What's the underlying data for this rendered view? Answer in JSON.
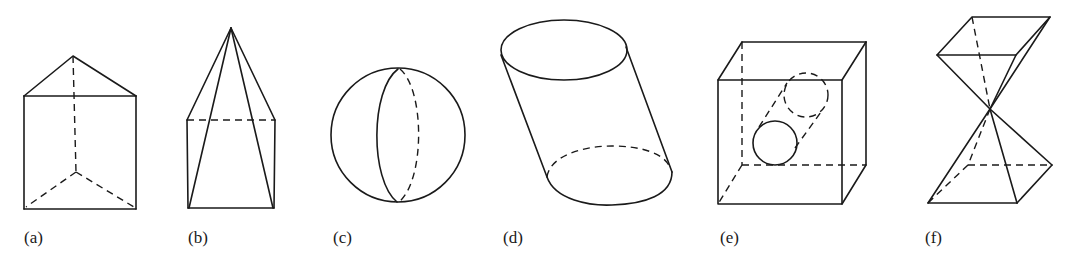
{
  "figure": {
    "panels": [
      {
        "id": "a",
        "label": "(a)",
        "shape": "triangular-prism"
      },
      {
        "id": "b",
        "label": "(b)",
        "shape": "pyramid-on-rectangular-prism"
      },
      {
        "id": "c",
        "label": "(c)",
        "shape": "sphere-with-great-circle"
      },
      {
        "id": "d",
        "label": "(d)",
        "shape": "oblique-cylinder"
      },
      {
        "id": "e",
        "label": "(e)",
        "shape": "cube-with-cylindrical-hole"
      },
      {
        "id": "f",
        "label": "(f)",
        "shape": "double-pyramid-vertex-to-vertex"
      }
    ],
    "colors": {
      "stroke": "#1a1a1a",
      "background": "#ffffff"
    }
  }
}
